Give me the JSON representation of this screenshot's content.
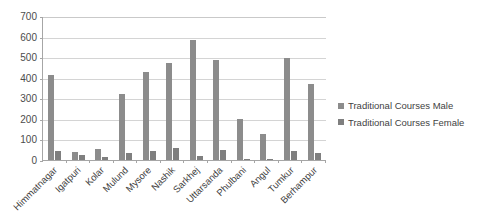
{
  "chart_data": {
    "type": "bar",
    "title": "",
    "xlabel": "",
    "ylabel": "",
    "ylim": [
      0,
      700
    ],
    "ytick_step": 100,
    "yticks": [
      700,
      600,
      500,
      400,
      300,
      200,
      100,
      0
    ],
    "grid": true,
    "legend_position": "right",
    "categories": [
      "Himmatnagar",
      "Igatpuri",
      "Kolar",
      "Mulund",
      "Mysore",
      "Nashik",
      "Sarkhej",
      "Uttarsanda",
      "Phulbani",
      "Angul",
      "Tumkur",
      "Berhampur"
    ],
    "series": [
      {
        "name": "Traditional Courses Male",
        "color": "#8c8c8c",
        "values": [
          415,
          38,
          55,
          320,
          430,
          473,
          583,
          485,
          198,
          125,
          497,
          370
        ]
      },
      {
        "name": "Traditional Courses Female",
        "color": "#7f7f7f",
        "values": [
          45,
          25,
          13,
          34,
          42,
          58,
          18,
          50,
          4,
          7,
          43,
          35
        ]
      }
    ]
  },
  "colors": {
    "series_male": "#8c8c8c",
    "series_female": "#7f7f7f",
    "gridline": "#d4d4d4",
    "axis": "#a6a6a6",
    "text": "#3f3f3f",
    "background": "#ffffff"
  }
}
